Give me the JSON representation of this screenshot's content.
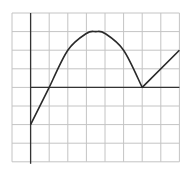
{
  "chart_data": {
    "type": "line",
    "title": "",
    "xlabel": "",
    "ylabel": "",
    "grid": true,
    "grid_cells": {
      "columns": 9,
      "rows": 8
    },
    "xlim": [
      -1,
      8
    ],
    "ylim": [
      -4,
      4
    ],
    "axis_origin_grid": {
      "column": 1,
      "row": 4
    },
    "series": [
      {
        "name": "f(x)",
        "segments": [
          {
            "kind": "line",
            "points": [
              [
                0,
                -2
              ],
              [
                1,
                0
              ]
            ]
          },
          {
            "kind": "curve",
            "points": [
              [
                1,
                0
              ],
              [
                2,
                2
              ],
              [
                3,
                2.9
              ],
              [
                3.5,
                3
              ],
              [
                4,
                2.9
              ],
              [
                5,
                2
              ],
              [
                6,
                0
              ]
            ]
          },
          {
            "kind": "line",
            "points": [
              [
                6,
                0
              ],
              [
                8,
                2
              ]
            ]
          }
        ],
        "x": [
          0,
          1,
          2,
          3,
          3.5,
          4,
          5,
          6,
          8
        ],
        "values": [
          -2,
          0,
          2,
          2.9,
          3,
          2.9,
          2,
          0,
          2
        ]
      }
    ],
    "annotations": []
  },
  "colors": {
    "grid": "#c4c4c4",
    "axis": "#333333",
    "curve": "#2a2a2a",
    "background": "#ffffff"
  }
}
